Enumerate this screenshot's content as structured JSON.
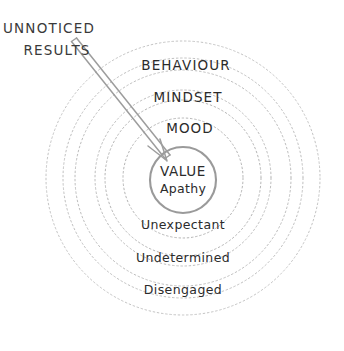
{
  "diagram": {
    "background_color": "#ffffff",
    "ring_stroke_color": "#b9b9b9",
    "core_stroke_color": "#8a8a8a",
    "text_color": "#2b2b2b",
    "arrow_color": "#9a9a9a",
    "center": {
      "x": 183,
      "y": 178
    },
    "rings": [
      {
        "label": "Disengaged",
        "radius": 137,
        "label_x": 183,
        "label_y": 294,
        "style": "lower"
      },
      {
        "label": "Undetermined",
        "radius": 108,
        "label_x": 183,
        "label_y": 262,
        "style": "lower"
      },
      {
        "label": "Unexpectant",
        "radius": 78,
        "label_x": 183,
        "label_y": 229,
        "style": "lower"
      },
      {
        "label": "MOOD",
        "radius": 60,
        "label_x": 190,
        "label_y": 133,
        "style": "upper"
      },
      {
        "label": "MINDSET",
        "radius": 88,
        "label_x": 188,
        "label_y": 102,
        "style": "upper"
      },
      {
        "label": "BEHAVIOUR",
        "radius": 120,
        "label_x": 186,
        "label_y": 70,
        "style": "upper"
      }
    ],
    "ring_order_outer_to_inner": [
      "Disengaged",
      "Undetermined",
      "Unexpectant",
      "MOOD",
      "MINDSET",
      "BEHAVIOUR"
    ],
    "core": {
      "radius": 33,
      "center_x": 183,
      "center_y": 180,
      "title": "VALUE",
      "subtitle": "Apathy",
      "title_x": 183,
      "title_y": 176,
      "subtitle_x": 183,
      "subtitle_y": 193
    },
    "callout": {
      "line_1": "UNNOTICED",
      "line_2": "RESULTS",
      "line_1_x": 49,
      "line_1_y": 33,
      "line_2_x": 57,
      "line_2_y": 55,
      "arrow_start_x": 73,
      "arrow_start_y": 44,
      "arrow_end_x": 167,
      "arrow_end_y": 161
    }
  }
}
